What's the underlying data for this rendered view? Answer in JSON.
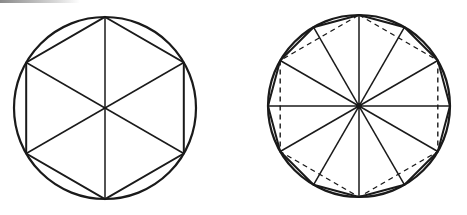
{
  "colors": {
    "stroke": "#1a1a1a",
    "background": "#ffffff",
    "topbar": "#8a8a8a"
  },
  "figures": [
    {
      "name": "circle-with-inscribed-hexagon",
      "cx": 105,
      "cy": 108,
      "r": 91,
      "polygon_sides": 6,
      "polygon_style": "solid",
      "radii": 6,
      "rotation_deg": -90
    },
    {
      "name": "circle-with-inscribed-dodecagon",
      "cx": 359,
      "cy": 106,
      "r": 91,
      "polygon_sides": 12,
      "polygon_style": "solid",
      "secondary_polygon_sides": 6,
      "secondary_polygon_style": "dashed",
      "radii": 12,
      "rotation_deg": -90
    }
  ]
}
